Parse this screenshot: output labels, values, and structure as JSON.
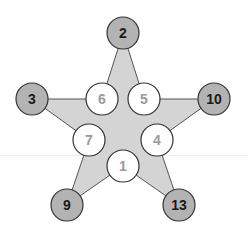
{
  "diagram": {
    "type": "magic-star",
    "colors": {
      "star_fill": "#d4d4d4",
      "star_stroke": "#555555",
      "outer_node_fill": "#b3b3b3",
      "inner_node_fill": "#ffffff",
      "node_stroke": "#333333",
      "outer_text": "#1a1a1a",
      "inner_text": "#9a9a9a"
    },
    "outer_nodes": [
      {
        "label": "2",
        "x": 123,
        "y": 33
      },
      {
        "label": "3",
        "x": 32,
        "y": 99
      },
      {
        "label": "10",
        "x": 214,
        "y": 99
      },
      {
        "label": "9",
        "x": 67,
        "y": 205
      },
      {
        "label": "13",
        "x": 179,
        "y": 205
      }
    ],
    "inner_nodes": [
      {
        "label": "6",
        "x": 102,
        "y": 99
      },
      {
        "label": "5",
        "x": 144,
        "y": 99
      },
      {
        "label": "7",
        "x": 89,
        "y": 140
      },
      {
        "label": "4",
        "x": 157,
        "y": 140
      },
      {
        "label": "1",
        "x": 123,
        "y": 166
      }
    ]
  }
}
